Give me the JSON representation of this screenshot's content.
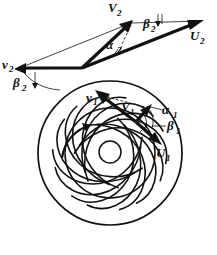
{
  "figure": {
    "background_color": "#ffffff",
    "ink_color": "#111111",
    "width": 217,
    "height": 255
  },
  "impeller": {
    "name": "centrifugal-impeller",
    "blade_count": 7,
    "blade_type": "backward-curved",
    "outer_circle": {
      "cx": 110,
      "cy": 153,
      "r": 72
    },
    "eye_circle": {
      "cx": 110,
      "cy": 153,
      "r": 45
    },
    "hub_circle": {
      "cx": 110,
      "cy": 152,
      "r": 11
    },
    "rotation_direction": "clockwise"
  },
  "labels": {
    "outlet": {
      "absolute_velocity": "V",
      "absolute_velocity_sub": "2",
      "relative_velocity": "v",
      "relative_velocity_sub": "2",
      "blade_velocity": "U",
      "blade_velocity_sub": "2",
      "alpha": "α",
      "alpha_sub": "2",
      "beta": "β",
      "beta_sub": "2",
      "beta_left": "β",
      "beta_left_sub": "2"
    },
    "inlet": {
      "absolute_velocity": "V",
      "absolute_velocity_sub": "1",
      "relative_velocity": "v",
      "relative_velocity_sub": "1",
      "blade_velocity": "U",
      "blade_velocity_sub": "1",
      "alpha": "α",
      "alpha_sub": "1",
      "beta": "β",
      "beta_sub": "1"
    }
  },
  "label_positions": {
    "V2": {
      "x": 108,
      "y": 12
    },
    "V2_sub": {
      "x": 117,
      "y": 16
    },
    "U2": {
      "x": 190,
      "y": 40
    },
    "U2_sub": {
      "x": 199,
      "y": 44
    },
    "beta2_right": {
      "x": 143,
      "y": 27
    },
    "beta2_right_sub": {
      "x": 151,
      "y": 31
    },
    "alpha2": {
      "x": 108,
      "y": 48
    },
    "alpha2_sub": {
      "x": 118,
      "y": 52
    },
    "v2_left": {
      "x": 3,
      "y": 69
    },
    "v2_left_sub": {
      "x": 10,
      "y": 73
    },
    "beta2_left": {
      "x": 14,
      "y": 86
    },
    "beta2_left_sub": {
      "x": 23,
      "y": 90
    },
    "v1": {
      "x": 88,
      "y": 101
    },
    "v1_sub": {
      "x": 95,
      "y": 105
    },
    "V1": {
      "x": 122,
      "y": 110
    },
    "V1_sub": {
      "x": 131,
      "y": 114
    },
    "alpha1": {
      "x": 163,
      "y": 113
    },
    "alpha1_sub": {
      "x": 173,
      "y": 117
    },
    "beta1": {
      "x": 167,
      "y": 129
    },
    "beta1_sub": {
      "x": 176,
      "y": 133
    },
    "U1": {
      "x": 157,
      "y": 156
    },
    "U1_sub": {
      "x": 166,
      "y": 160
    }
  },
  "vectors": {
    "outlet_vertex": {
      "x": 82,
      "y": 68
    },
    "V2_tip": {
      "x": 131,
      "y": 23
    },
    "U2_tip": {
      "x": 202,
      "y": 21
    },
    "v2_tip": {
      "x": 17,
      "y": 69
    },
    "inlet_vertex": {
      "x": 136,
      "y": 122
    },
    "V1_tip": {
      "x": 150,
      "y": 107
    },
    "v1_tip": {
      "x": 97,
      "y": 92
    },
    "U1_tip": {
      "x": 160,
      "y": 142
    }
  }
}
